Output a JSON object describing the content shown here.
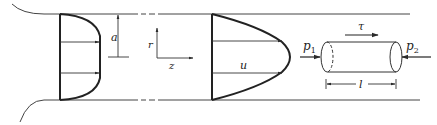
{
  "diagram": {
    "colors": {
      "stroke": "#2a2a2a",
      "background": "#ffffff"
    },
    "labels": {
      "radius": "a",
      "axis_r": "r",
      "axis_z": "z",
      "velocity": "u",
      "pressure_in": "p",
      "pressure_in_sub": "1",
      "pressure_out": "p",
      "pressure_out_sub": "2",
      "shear": "τ",
      "length": "l"
    },
    "elements": [
      {
        "name": "pipe-wall-top",
        "kind": "line"
      },
      {
        "name": "pipe-wall-bottom",
        "kind": "line"
      },
      {
        "name": "entrance-profile",
        "kind": "velocity-profile",
        "shape": "plug"
      },
      {
        "name": "developed-profile",
        "kind": "velocity-profile",
        "shape": "parabolic"
      },
      {
        "name": "fluid-element",
        "kind": "cylinder"
      }
    ]
  }
}
